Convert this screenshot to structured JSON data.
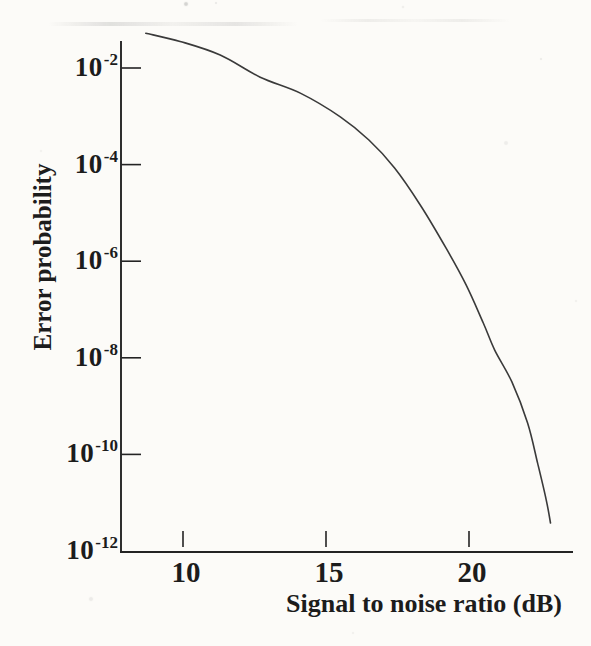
{
  "figure": {
    "paper_color": "#fcfbf8",
    "ink_color": "#242424",
    "curve_color": "#3a3a3a"
  },
  "chart_data": {
    "type": "line",
    "title": "",
    "xlabel": "Signal to noise ratio (dB)",
    "ylabel": "Error probability",
    "grid": false,
    "legend": null,
    "x_axis": {
      "scale": "linear",
      "ticks": [
        10,
        15,
        20
      ],
      "range_db": [
        7.8,
        23.6
      ]
    },
    "y_axis": {
      "scale": "log",
      "tick_base": "10",
      "tick_exponents": [
        "-2",
        "-4",
        "-6",
        "-8",
        "-10",
        "-12"
      ],
      "range_log10": [
        -12.0,
        -1.44
      ]
    },
    "series": [
      {
        "name": "error-probability-vs-snr",
        "points_db_log10p": [
          [
            8.7,
            -1.28
          ],
          [
            9.9,
            -1.45
          ],
          [
            11.3,
            -1.73
          ],
          [
            12.7,
            -2.19
          ],
          [
            14.1,
            -2.52
          ],
          [
            15.5,
            -3.01
          ],
          [
            16.5,
            -3.49
          ],
          [
            17.4,
            -4.07
          ],
          [
            18.3,
            -4.84
          ],
          [
            19.2,
            -5.73
          ],
          [
            19.9,
            -6.49
          ],
          [
            20.5,
            -7.28
          ],
          [
            20.9,
            -7.84
          ],
          [
            21.5,
            -8.5
          ],
          [
            22.05,
            -9.35
          ],
          [
            22.4,
            -10.18
          ],
          [
            22.7,
            -10.94
          ],
          [
            22.85,
            -11.42
          ]
        ]
      }
    ]
  }
}
